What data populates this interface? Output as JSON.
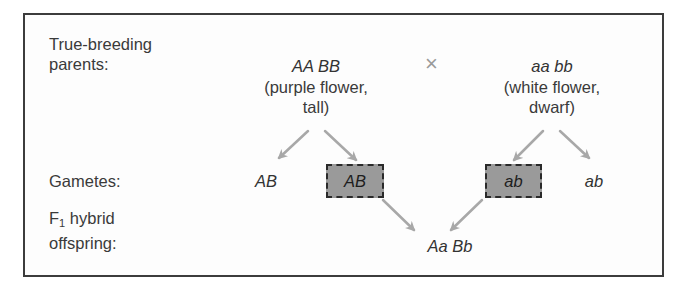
{
  "diagram": {
    "row_labels": {
      "parents_line1": "True-breeding",
      "parents_line2": "parents:",
      "gametes": "Gametes:",
      "f1_line1_prefix": "F",
      "f1_line1_sub": "1",
      "f1_line1_suffix": " hybrid",
      "f1_line2": "offspring:"
    },
    "parent_left": {
      "genotype": "AA BB",
      "phenotype_line1": "(purple flower,",
      "phenotype_line2": "tall)"
    },
    "cross_symbol": "×",
    "parent_right": {
      "genotype": "aa bb",
      "phenotype_line1": "(white flower,",
      "phenotype_line2": "dwarf)"
    },
    "gametes": [
      {
        "label": "AB",
        "highlighted": false
      },
      {
        "label": "AB",
        "highlighted": true
      },
      {
        "label": "ab",
        "highlighted": true
      },
      {
        "label": "ab",
        "highlighted": false
      }
    ],
    "offspring": {
      "genotype": "Aa Bb"
    },
    "colors": {
      "border": "#3c3c3c",
      "arrow": "#a8a8a8",
      "highlight_fill": "#9a9a9a",
      "text": "#3a3a3a"
    }
  }
}
